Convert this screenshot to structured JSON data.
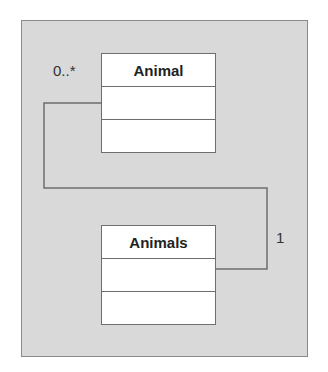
{
  "diagram": {
    "type": "uml-class-diagram",
    "classes": [
      {
        "name": "Animal",
        "attributes": [],
        "operations": []
      },
      {
        "name": "Animals",
        "attributes": [],
        "operations": []
      }
    ],
    "association": {
      "from": "Animals",
      "to": "Animal",
      "multiplicity_from": "1",
      "multiplicity_to": "0..*"
    },
    "colors": {
      "background": "#d9d9d9",
      "box_fill": "#ffffff",
      "line": "#6e6e6e"
    }
  }
}
